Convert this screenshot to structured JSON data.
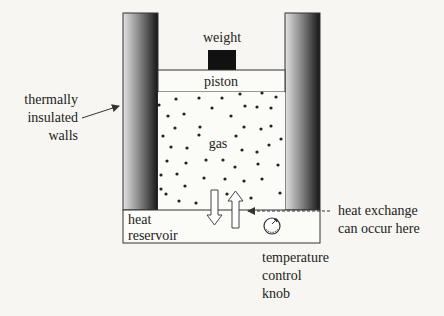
{
  "labels": {
    "weight": "weight",
    "piston": "piston",
    "gas": "gas",
    "walls": [
      "thermally",
      "insulated",
      "walls"
    ],
    "reservoir": [
      "heat",
      "reservoir"
    ],
    "exchange": [
      "heat exchange",
      "can occur here"
    ],
    "knob": [
      "temperature",
      "control",
      "knob"
    ]
  },
  "colors": {
    "wall_light": "#d8d8d8",
    "wall_dark": "#1a1a1a",
    "weight": "#111111",
    "line": "#333333",
    "background": "#f7f6f2"
  },
  "gas_particles": [
    [
      176,
      99
    ],
    [
      199,
      98
    ],
    [
      222,
      98
    ],
    [
      240,
      94
    ],
    [
      262,
      93
    ],
    [
      276,
      97
    ],
    [
      159,
      105
    ],
    [
      212,
      108
    ],
    [
      245,
      106
    ],
    [
      257,
      107
    ],
    [
      271,
      108
    ],
    [
      168,
      116
    ],
    [
      184,
      114
    ],
    [
      231,
      116
    ],
    [
      175,
      128
    ],
    [
      200,
      127
    ],
    [
      244,
      127
    ],
    [
      261,
      129
    ],
    [
      271,
      126
    ],
    [
      163,
      136
    ],
    [
      199,
      135
    ],
    [
      236,
      136
    ],
    [
      281,
      139
    ],
    [
      171,
      147
    ],
    [
      187,
      148
    ],
    [
      242,
      150
    ],
    [
      257,
      152
    ],
    [
      269,
      145
    ],
    [
      167,
      161
    ],
    [
      186,
      163
    ],
    [
      206,
      160
    ],
    [
      223,
      160
    ],
    [
      235,
      167
    ],
    [
      258,
      164
    ],
    [
      278,
      165
    ],
    [
      161,
      175
    ],
    [
      177,
      174
    ],
    [
      204,
      178
    ],
    [
      225,
      179
    ],
    [
      244,
      181
    ],
    [
      262,
      179
    ],
    [
      185,
      186
    ],
    [
      227,
      194
    ],
    [
      166,
      194
    ],
    [
      179,
      201
    ],
    [
      196,
      203
    ],
    [
      214,
      201
    ],
    [
      280,
      193
    ],
    [
      161,
      189
    ],
    [
      251,
      198
    ]
  ]
}
